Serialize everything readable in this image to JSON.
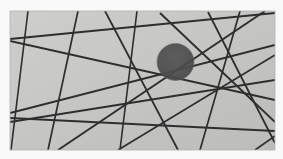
{
  "figure": {
    "canvas": {
      "width": 283,
      "height": 159
    },
    "margin": {
      "left": 10,
      "top": 11,
      "right": 8,
      "bottom": 9
    },
    "colors": {
      "page_background": "#fdfdfd",
      "plate_background": "#c9c9c7",
      "plate_background_light": "#d2d2d0",
      "plate_background_dark": "#bdbdbb",
      "line_color": "#2e2e2e",
      "line_color_soft": "#4a4a4a",
      "disc_fill": "#565656",
      "disc_edge": "#6a6a6a",
      "plate_border": "#b4b4b2"
    },
    "plate": {
      "x": 10,
      "y": 11,
      "width": 265,
      "height": 139
    },
    "disc": {
      "label": "dark-circle",
      "cx": 175.5,
      "cy": 62,
      "r": 18.5,
      "fill": "#565656"
    },
    "lines": [
      {
        "id": "L1",
        "x1": 28,
        "y1": 11,
        "x2": 11,
        "y2": 150,
        "width": 1.6
      },
      {
        "id": "L2",
        "x1": 78,
        "y1": 11,
        "x2": 48,
        "y2": 150,
        "width": 1.7
      },
      {
        "id": "L3",
        "x1": 105,
        "y1": 11,
        "x2": 178,
        "y2": 150,
        "width": 1.8
      },
      {
        "id": "L4",
        "x1": 137,
        "y1": 11,
        "x2": 120,
        "y2": 150,
        "width": 1.6
      },
      {
        "id": "L5",
        "x1": 160,
        "y1": 13,
        "x2": 275,
        "y2": 122,
        "width": 1.9
      },
      {
        "id": "L6",
        "x1": 208,
        "y1": 12,
        "x2": 275,
        "y2": 143,
        "width": 1.8
      },
      {
        "id": "L7",
        "x1": 240,
        "y1": 11,
        "x2": 200,
        "y2": 150,
        "width": 1.7
      },
      {
        "id": "L8",
        "x1": 10,
        "y1": 39,
        "x2": 275,
        "y2": 13,
        "width": 1.8
      },
      {
        "id": "L9",
        "x1": 10,
        "y1": 41,
        "x2": 275,
        "y2": 100,
        "width": 1.9
      },
      {
        "id": "L10",
        "x1": 10,
        "y1": 113,
        "x2": 275,
        "y2": 45,
        "width": 1.9
      },
      {
        "id": "L11",
        "x1": 10,
        "y1": 118,
        "x2": 275,
        "y2": 131,
        "width": 1.8
      },
      {
        "id": "L12",
        "x1": 10,
        "y1": 122,
        "x2": 275,
        "y2": 80,
        "width": 1.8
      },
      {
        "id": "L13",
        "x1": 58,
        "y1": 150,
        "x2": 265,
        "y2": 11,
        "width": 1.9
      },
      {
        "id": "L14",
        "x1": 118,
        "y1": 150,
        "x2": 275,
        "y2": 55,
        "width": 1.7
      },
      {
        "id": "L15",
        "x1": 255,
        "y1": 150,
        "x2": 275,
        "y2": 136,
        "width": 1.7
      }
    ]
  }
}
